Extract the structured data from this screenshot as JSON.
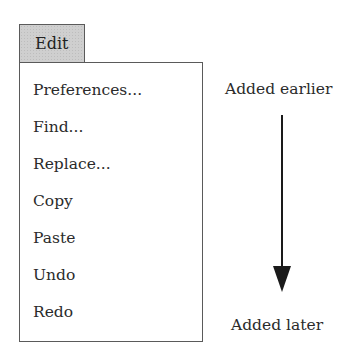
{
  "menu": {
    "title": "Edit",
    "items": [
      {
        "label": "Preferences..."
      },
      {
        "label": "Find..."
      },
      {
        "label": "Replace..."
      },
      {
        "label": "Copy"
      },
      {
        "label": "Paste"
      },
      {
        "label": "Undo"
      },
      {
        "label": "Redo"
      }
    ]
  },
  "annotation": {
    "top_label": "Added earlier",
    "bottom_label": "Added later",
    "arrow": "arrow-down-icon"
  }
}
